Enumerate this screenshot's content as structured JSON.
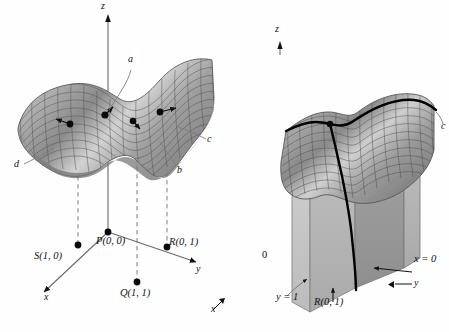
{
  "figure": {
    "background_color": "#fefefe",
    "ink_color": "#111111",
    "surface_fill_light": "#d9d9d9",
    "surface_fill_dark": "#8c8c8c",
    "plane_fill": "#b5b5b5",
    "plane_fill_dark": "#9a9a9a",
    "curve_color": "#000000",
    "dash_color": "#7a7a7a"
  },
  "left_panel": {
    "axes": {
      "z": "z",
      "y": "y",
      "x": "x"
    },
    "vector_labels": [
      {
        "id": "a",
        "text": "a"
      },
      {
        "id": "b",
        "text": "b"
      },
      {
        "id": "c",
        "text": "c"
      },
      {
        "id": "d",
        "text": "d"
      }
    ],
    "points": [
      {
        "id": "P",
        "text": "P(0, 0)"
      },
      {
        "id": "Q",
        "text": "Q(1, 1)"
      },
      {
        "id": "R",
        "text": "R(0, 1)"
      },
      {
        "id": "S",
        "text": "S(1, 0)"
      }
    ]
  },
  "right_panel": {
    "axes": {
      "z": "z",
      "y": "y",
      "x": "x"
    },
    "curve_label": "c",
    "origin_label": "0",
    "plane_labels": [
      {
        "id": "y1",
        "text": "y = 1"
      },
      {
        "id": "x0",
        "text": "x = 0"
      }
    ],
    "points": [
      {
        "id": "R",
        "text": "R(0, 1)"
      }
    ]
  }
}
